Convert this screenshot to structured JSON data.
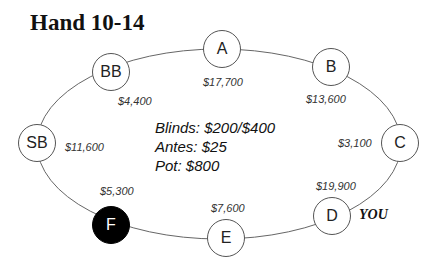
{
  "title": "Hand 10-14",
  "table": {
    "info": {
      "blinds": "Blinds: $200/$400",
      "antes": "Antes: $25",
      "pot": "Pot: $800"
    },
    "hero_label": "YOU",
    "seats": [
      {
        "label": "A",
        "stack": "$17,700",
        "highlighted": false
      },
      {
        "label": "B",
        "stack": "$13,600",
        "highlighted": false
      },
      {
        "label": "C",
        "stack": "$3,100",
        "highlighted": false
      },
      {
        "label": "D",
        "stack": "$19,900",
        "highlighted": false,
        "hero": true
      },
      {
        "label": "E",
        "stack": "$7,600",
        "highlighted": false
      },
      {
        "label": "F",
        "stack": "$5,300",
        "highlighted": true
      },
      {
        "label": "SB",
        "stack": "$11,600",
        "highlighted": false
      },
      {
        "label": "BB",
        "stack": "$4,400",
        "highlighted": false
      }
    ]
  },
  "colors": {
    "highlight_fill": "#000000",
    "outline": "#555555"
  }
}
